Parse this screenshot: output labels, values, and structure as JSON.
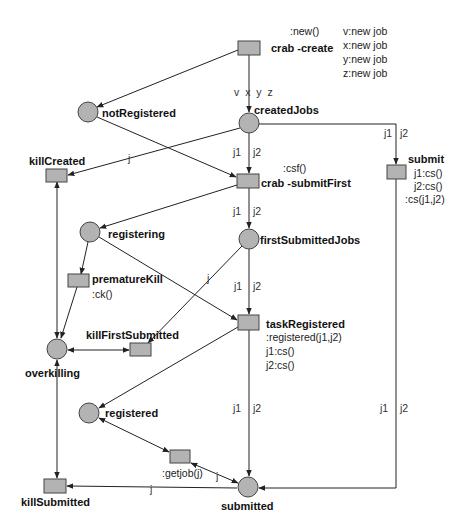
{
  "diagram": {
    "type": "petri-net",
    "colors": {
      "node_fill": "#b3b3b3",
      "node_stroke": "#444444",
      "edge": "#222222",
      "background": "#ffffff"
    },
    "places": [
      {
        "id": "createdJobs",
        "label": "createdJobs"
      },
      {
        "id": "notRegistered",
        "label": "notRegistered"
      },
      {
        "id": "registering",
        "label": "registering"
      },
      {
        "id": "firstSubmittedJobs",
        "label": "firstSubmittedJobs"
      },
      {
        "id": "overkilling",
        "label": "overkilling"
      },
      {
        "id": "registered",
        "label": "registered"
      },
      {
        "id": "submitted",
        "label": "submitted"
      }
    ],
    "transitions": [
      {
        "id": "crab_create",
        "label": "crab -create",
        "annotations": [
          ":new()"
        ]
      },
      {
        "id": "killCreated",
        "label": "killCreated",
        "annotations": []
      },
      {
        "id": "crab_submitFirst",
        "label": "crab -submitFirst",
        "annotations": [
          ":csf()"
        ]
      },
      {
        "id": "submit",
        "label": "submit",
        "annotations": [
          "j1:cs()",
          "j2:cs()",
          ":cs(j1,j2)"
        ]
      },
      {
        "id": "prematureKill",
        "label": "prematureKill",
        "annotations": [
          ":ck()"
        ]
      },
      {
        "id": "killFirstSubmitted",
        "label": "killFirstSubmitted",
        "annotations": []
      },
      {
        "id": "taskRegistered",
        "label": "taskRegistered",
        "annotations": [
          ":registered(j1,j2)",
          "j1:cs()",
          "j2:cs()"
        ]
      },
      {
        "id": "getjob",
        "label": "",
        "annotations": [
          ":getjob(j)"
        ]
      },
      {
        "id": "killSubmitted",
        "label": "killSubmitted",
        "annotations": []
      }
    ],
    "create_outputs": [
      "v:new job",
      "x:new job",
      "y:new job",
      "z:new job"
    ],
    "arc_labels": {
      "create_to_created": "v  x  y  z",
      "created_to_killCreated": "j",
      "created_to_submitFirst_a": "j1",
      "created_to_submitFirst_b": "j2",
      "created_to_submit_a": "j1",
      "created_to_submit_b": "j2",
      "submitFirst_to_firstSubmitted_a": "j1",
      "submitFirst_to_firstSubmitted_b": "j2",
      "firstSubmitted_to_killFirstSubmitted": "j",
      "firstSubmitted_to_taskRegistered_a": "j1",
      "firstSubmitted_to_taskRegistered_b": "j2",
      "taskRegistered_to_submitted_a": "j1",
      "taskRegistered_to_submitted_b": "j2",
      "submit_to_submitted_a": "j1",
      "submit_to_submitted_b": "j2",
      "getjob_to_submitted": "j",
      "submitted_to_killSubmitted": "j"
    }
  }
}
